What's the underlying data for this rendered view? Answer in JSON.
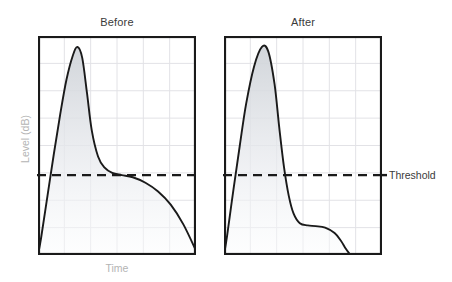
{
  "figure": {
    "ylabel": "Level (dB)",
    "xlabel": "Time",
    "threshold_label": "Threshold",
    "colors": {
      "curve": "#1a1a1a",
      "grid": "#e2e2e6",
      "frame": "#1a1a1a",
      "fill_top": "#cfd3d8",
      "fill_bottom": "#fbfcfd",
      "axis_label": "#b4b4b4",
      "title": "#3a3a3a"
    }
  },
  "panels": [
    {
      "id": "before",
      "title": "Before"
    },
    {
      "id": "after",
      "title": "After"
    }
  ],
  "chart_data": {
    "type": "line",
    "title": "",
    "xlabel": "Time",
    "ylabel": "Level (dB)",
    "xlim": [
      0,
      1
    ],
    "ylim": [
      0,
      1
    ],
    "grid": true,
    "grid_cols": 6,
    "grid_rows": 8,
    "legend": "none",
    "annotations": [
      {
        "name": "threshold",
        "type": "hline",
        "y": 0.365,
        "label": "Threshold",
        "style": "dashed"
      }
    ],
    "series": [
      {
        "name": "Before",
        "panel": "before",
        "fill": true,
        "x": [
          0.0,
          0.02,
          0.06,
          0.1,
          0.14,
          0.18,
          0.22,
          0.25,
          0.28,
          0.31,
          0.34,
          0.38,
          0.42,
          0.47,
          0.53,
          0.6,
          0.68,
          0.76,
          0.84,
          0.92,
          1.0
        ],
        "y": [
          0.0,
          0.08,
          0.27,
          0.46,
          0.64,
          0.8,
          0.91,
          0.95,
          0.9,
          0.74,
          0.57,
          0.45,
          0.4,
          0.375,
          0.365,
          0.355,
          0.33,
          0.29,
          0.23,
          0.14,
          0.02
        ]
      },
      {
        "name": "After",
        "panel": "after",
        "fill": true,
        "x": [
          0.0,
          0.02,
          0.06,
          0.1,
          0.14,
          0.19,
          0.24,
          0.28,
          0.32,
          0.35,
          0.38,
          0.41,
          0.44,
          0.48,
          0.53,
          0.58,
          0.64,
          0.7,
          0.74,
          0.77,
          0.8
        ],
        "y": [
          0.0,
          0.09,
          0.3,
          0.5,
          0.69,
          0.86,
          0.95,
          0.93,
          0.78,
          0.58,
          0.4,
          0.27,
          0.19,
          0.145,
          0.135,
          0.132,
          0.125,
          0.1,
          0.065,
          0.03,
          0.0
        ]
      }
    ]
  }
}
